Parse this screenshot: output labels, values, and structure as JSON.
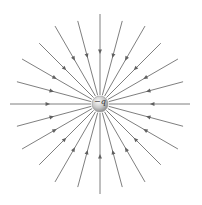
{
  "diagram": {
    "charge_label": "−q",
    "center": [
      100,
      104
    ],
    "charge_radius": 8,
    "line_count": 24,
    "line_inner_radius": 9,
    "line_outer_radius": 90,
    "arrow_direction": "inward",
    "colors": {
      "line": "#707070",
      "arrow": "#606060",
      "charge_light": "#f4f4f4",
      "charge_dark": "#9a9a9a"
    }
  }
}
